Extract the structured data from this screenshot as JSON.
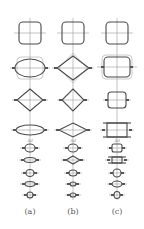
{
  "diagram": {
    "type": "cross-section-deformation-sequence",
    "colors": {
      "shape": "#4a4a4a",
      "ghost": "#a8a8a8",
      "axis": "#9a9a9a",
      "text": "#555555"
    },
    "columns": [
      {
        "id": "a",
        "label": "(a)",
        "cx": 30,
        "axis": {
          "y1": 18,
          "y2": 200
        },
        "annotation": {
          "text": "Δd",
          "y": 141
        },
        "rows": [
          {
            "y": 33,
            "kind": "rounded-square",
            "w": 22,
            "h": 22,
            "r": 4
          },
          {
            "y": 68,
            "kind": "ellipse",
            "w": 30,
            "h": 18,
            "ghost": "rounded-rect",
            "gw": 26,
            "gh": 22
          },
          {
            "y": 100,
            "kind": "diamond",
            "w": 26,
            "h": 22
          },
          {
            "y": 130,
            "kind": "ellipse",
            "w": 28,
            "h": 10
          },
          {
            "y": 148,
            "kind": "ellipse",
            "w": 10,
            "h": 8
          },
          {
            "y": 160,
            "kind": "ellipse",
            "w": 12,
            "h": 5
          },
          {
            "y": 173,
            "kind": "ellipse",
            "w": 8,
            "h": 7
          },
          {
            "y": 184,
            "kind": "ellipse",
            "w": 10,
            "h": 5
          },
          {
            "y": 195,
            "kind": "ellipse",
            "w": 6,
            "h": 6
          }
        ]
      },
      {
        "id": "b",
        "label": "(b)",
        "cx": 73,
        "axis": {
          "y1": 18,
          "y2": 200
        },
        "annotation": {
          "text": "Δd",
          "y": 141
        },
        "rows": [
          {
            "y": 33,
            "kind": "rounded-square",
            "w": 22,
            "h": 22,
            "r": 4
          },
          {
            "y": 68,
            "kind": "diamond",
            "w": 32,
            "h": 24,
            "ghost": "diamond",
            "gw": 28,
            "gh": 30
          },
          {
            "y": 100,
            "kind": "diamond",
            "w": 22,
            "h": 22
          },
          {
            "y": 130,
            "kind": "diamond",
            "w": 28,
            "h": 14
          },
          {
            "y": 148,
            "kind": "ellipse",
            "w": 10,
            "h": 8
          },
          {
            "y": 160,
            "kind": "diamond",
            "w": 14,
            "h": 8
          },
          {
            "y": 173,
            "kind": "ellipse",
            "w": 8,
            "h": 6
          },
          {
            "y": 184,
            "kind": "ellipse",
            "w": 6,
            "h": 4
          },
          {
            "y": 195,
            "kind": "ellipse",
            "w": 6,
            "h": 4
          }
        ]
      },
      {
        "id": "c",
        "label": "(c)",
        "cx": 117,
        "axis": {
          "y1": 18,
          "y2": 200
        },
        "annotation": {
          "text": "Δd",
          "y": 141
        },
        "rows": [
          {
            "y": 33,
            "kind": "rounded-square",
            "w": 22,
            "h": 22,
            "r": 4
          },
          {
            "y": 67,
            "kind": "rounded-square",
            "w": 26,
            "h": 20,
            "r": 4,
            "ghost": "rounded-rect",
            "gw": 30,
            "gh": 24
          },
          {
            "y": 100,
            "kind": "rounded-square",
            "w": 18,
            "h": 16,
            "r": 3
          },
          {
            "y": 130,
            "kind": "framed-rect",
            "w": 24,
            "h": 14
          },
          {
            "y": 148,
            "kind": "rounded-square",
            "w": 10,
            "h": 8,
            "r": 2
          },
          {
            "y": 160,
            "kind": "framed-rect",
            "w": 14,
            "h": 6
          },
          {
            "y": 173,
            "kind": "ellipse",
            "w": 8,
            "h": 8
          },
          {
            "y": 184,
            "kind": "ellipse",
            "w": 10,
            "h": 6
          },
          {
            "y": 195,
            "kind": "ellipse",
            "w": 6,
            "h": 7
          }
        ]
      }
    ],
    "label_y": 207
  }
}
